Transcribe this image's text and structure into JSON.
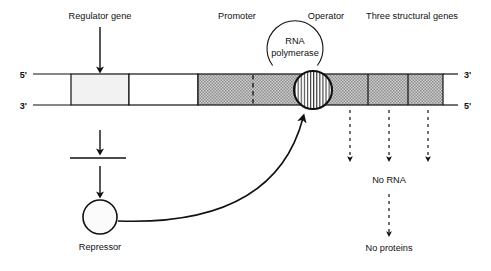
{
  "figure": {
    "background_color": "#ffffff",
    "line_color": "#111111",
    "shade_color": "#b4b4b4",
    "light_fill": "#f0f0f0"
  },
  "labels": {
    "regulator_gene": "Regulator gene",
    "promoter": "Promoter",
    "operator": "Operator",
    "structural_genes": "Three structural genes",
    "rna_polymerase_line1": "RNA",
    "rna_polymerase_line2": "polymerase",
    "repressor": "Repressor",
    "no_rna": "No RNA",
    "no_proteins": "No proteins"
  },
  "strand_ends": {
    "left_top": "5'",
    "left_bottom": "3'",
    "right_top": "3'",
    "right_bottom": "5'"
  },
  "dna_bar": {
    "x_start": 33,
    "x_end": 443,
    "y_top": 74,
    "y_bottom": 105,
    "regulator_box": {
      "x1": 71,
      "x2": 129
    },
    "unshaded_gap": {
      "x1": 129,
      "x2": 198
    },
    "shaded_start": 198,
    "promoter_dashed_divider": 253,
    "structural_dividers": [
      368,
      408
    ],
    "operator_circle": {
      "cx": 313,
      "cy": 90,
      "r": 19
    }
  },
  "rna_polymerase_circle": {
    "cx": 295,
    "cy": 47,
    "r": 28
  },
  "repressor_circle": {
    "cx": 100,
    "cy": 217,
    "r": 17
  },
  "mrna_line": {
    "x1": 70,
    "x2": 126,
    "y": 158
  },
  "downward_arrows": [
    {
      "name": "regulator-to-mrna",
      "x": 100,
      "y1": 27,
      "y2": 71
    },
    {
      "name": "mrna-transcript",
      "x": 100,
      "y1": 130,
      "y2": 153
    },
    {
      "name": "mrna-to-repressor",
      "x": 100,
      "y1": 166,
      "y2": 196
    }
  ],
  "dashed_arrows": [
    {
      "name": "no-rna-arrow-1",
      "x": 350,
      "y1": 110,
      "y2": 163
    },
    {
      "name": "no-rna-arrow-2",
      "x": 389,
      "y1": 110,
      "y2": 163
    },
    {
      "name": "no-rna-arrow-3",
      "x": 428,
      "y1": 110,
      "y2": 163
    },
    {
      "name": "no-proteins-arrow",
      "x": 389,
      "y1": 194,
      "y2": 238
    }
  ]
}
